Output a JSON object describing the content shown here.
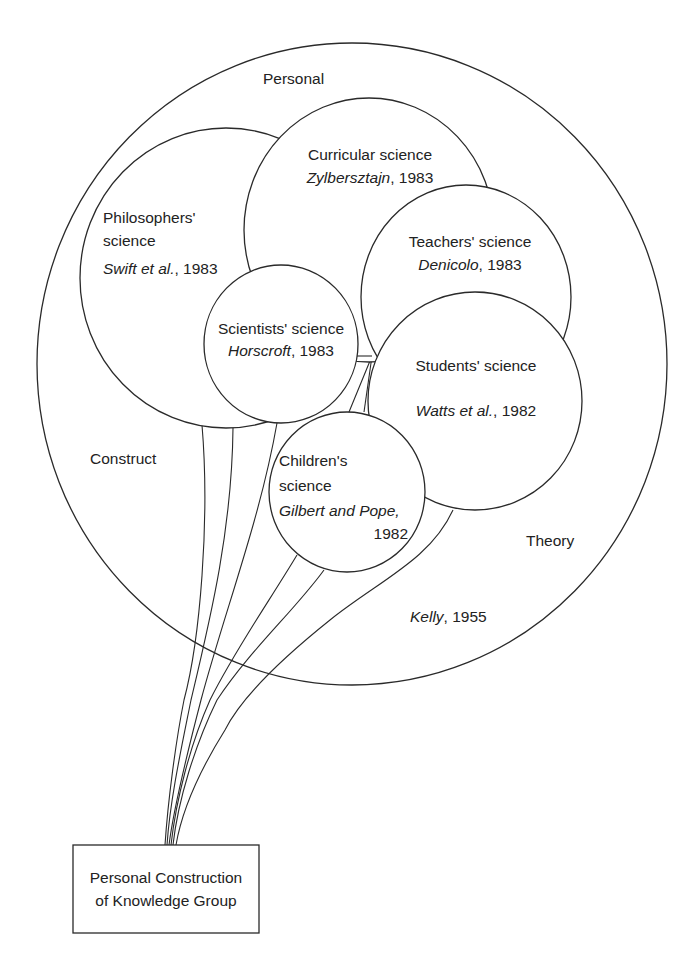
{
  "diagram": {
    "outer_circle": {
      "labels": {
        "personal": "Personal",
        "construct": "Construct",
        "theory": "Theory",
        "author": "Kelly",
        "year_suffix": ", 1955"
      }
    },
    "circles": {
      "philosophers": {
        "line1": "Philosophers'",
        "line2": "science",
        "author": "Swift et al.",
        "year_suffix": ", 1983"
      },
      "curricular": {
        "line1": "Curricular science",
        "author": "Zylbersztajn",
        "year_suffix": ", 1983"
      },
      "teachers": {
        "line1": "Teachers' science",
        "author": "Denicolo",
        "year_suffix": ", 1983"
      },
      "scientists": {
        "line1": "Scientists' science",
        "author": "Horscroft",
        "year_suffix": ", 1983"
      },
      "students": {
        "line1": "Students' science",
        "author": "Watts et al.",
        "year_suffix": ", 1982"
      },
      "children": {
        "line1": "Children's",
        "line2": "science",
        "author": "Gilbert and Pope,",
        "year": "1982"
      }
    },
    "anchor_box": {
      "line1": "Personal Construction",
      "line2": "of Knowledge Group"
    }
  }
}
